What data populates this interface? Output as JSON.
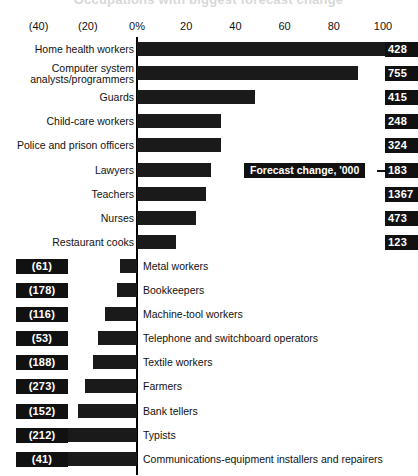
{
  "title_partial": "Occupations with biggest forecast change",
  "axis": {
    "ticks": [
      "(40)",
      "(20)",
      "0%",
      "20",
      "40",
      "60",
      "80",
      "100"
    ],
    "tick_values": [
      -40,
      -20,
      0,
      20,
      40,
      60,
      80,
      100
    ]
  },
  "legend": {
    "label": "Forecast change, '000"
  },
  "chart_data": {
    "type": "bar",
    "orientation": "horizontal",
    "title": "Occupations with biggest forecast change",
    "xlabel": "Percent change",
    "ylabel": "",
    "xlim": [
      -40,
      110
    ],
    "grid": false,
    "legend_position": "inline-right",
    "value_label_name": "Forecast change, '000",
    "categories": [
      "Home health workers",
      "Computer system analysts/programmers",
      "Guards",
      "Child-care workers",
      "Police and prison officers",
      "Lawyers",
      "Teachers",
      "Nurses",
      "Restaurant cooks",
      "Metal workers",
      "Bookkeepers",
      "Machine-tool workers",
      "Telephone and switchboard operators",
      "Textile workers",
      "Farmers",
      "Bank tellers",
      "Typists",
      "Communications-equipment installers and repairers"
    ],
    "values": [
      103,
      90,
      48,
      34,
      34,
      30,
      28,
      24,
      16,
      -7,
      -8,
      -13,
      -16,
      -18,
      -21,
      -24,
      -30,
      -33
    ],
    "value_labels": [
      "428",
      "755",
      "415",
      "248",
      "324",
      "183",
      "1367",
      "473",
      "123",
      "(61)",
      "(178)",
      "(116)",
      "(53)",
      "(188)",
      "(273)",
      "(152)",
      "(212)",
      "(41)"
    ]
  },
  "rows": [
    {
      "label": "Home health workers",
      "label2": "",
      "pct": 103,
      "chip": "428",
      "side": "right"
    },
    {
      "label": "Computer system",
      "label2": "analysts/programmers",
      "pct": 90,
      "chip": "755",
      "side": "right"
    },
    {
      "label": "Guards",
      "label2": "",
      "pct": 48,
      "chip": "415",
      "side": "right"
    },
    {
      "label": "Child-care workers",
      "label2": "",
      "pct": 34,
      "chip": "248",
      "side": "right"
    },
    {
      "label": "Police and prison officers",
      "label2": "",
      "pct": 34,
      "chip": "324",
      "side": "right"
    },
    {
      "label": "Lawyers",
      "label2": "",
      "pct": 30,
      "chip": "183",
      "side": "right"
    },
    {
      "label": "Teachers",
      "label2": "",
      "pct": 28,
      "chip": "1367",
      "side": "right"
    },
    {
      "label": "Nurses",
      "label2": "",
      "pct": 24,
      "chip": "473",
      "side": "right"
    },
    {
      "label": "Restaurant cooks",
      "label2": "",
      "pct": 16,
      "chip": "123",
      "side": "right"
    },
    {
      "label": "Metal workers",
      "label2": "",
      "pct": -7,
      "chip": "(61)",
      "side": "left"
    },
    {
      "label": "Bookkeepers",
      "label2": "",
      "pct": -8,
      "chip": "(178)",
      "side": "left"
    },
    {
      "label": "Machine-tool workers",
      "label2": "",
      "pct": -13,
      "chip": "(116)",
      "side": "left"
    },
    {
      "label": "Telephone and switchboard operators",
      "label2": "",
      "pct": -16,
      "chip": "(53)",
      "side": "left"
    },
    {
      "label": "Textile workers",
      "label2": "",
      "pct": -18,
      "chip": "(188)",
      "side": "left"
    },
    {
      "label": "Farmers",
      "label2": "",
      "pct": -21,
      "chip": "(273)",
      "side": "left"
    },
    {
      "label": "Bank tellers",
      "label2": "",
      "pct": -24,
      "chip": "(152)",
      "side": "left"
    },
    {
      "label": "Typists",
      "label2": "",
      "pct": -30,
      "chip": "(212)",
      "side": "left"
    },
    {
      "label": "Communications-equipment installers and repairers",
      "label2": "",
      "pct": -33,
      "chip": "(41)",
      "side": "left"
    }
  ]
}
